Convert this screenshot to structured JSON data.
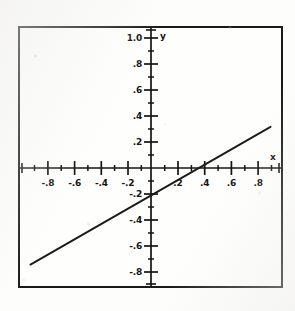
{
  "chart_data": {
    "type": "line",
    "title": "",
    "subtitle": "",
    "xlabel": "x",
    "ylabel": "y",
    "xlim": [
      -1.0,
      1.0
    ],
    "ylim": [
      -1.0,
      1.0
    ],
    "grid": false,
    "legend": null,
    "x_tick_labels": [
      "-.8",
      "-.6",
      "-.4",
      "-.2",
      ".2",
      ".4",
      ".6",
      ".8"
    ],
    "x_tick_values": [
      -0.8,
      -0.6,
      -0.4,
      -0.2,
      0.2,
      0.4,
      0.6,
      0.8
    ],
    "y_tick_labels": [
      "1.0",
      ".8",
      ".6",
      ".4",
      ".2",
      "-.2",
      "-.4",
      "-.6",
      "-.8"
    ],
    "y_tick_values": [
      1.0,
      0.8,
      0.6,
      0.4,
      0.2,
      -0.2,
      -0.4,
      -0.6,
      -0.8
    ],
    "minor_tick_step": 0.1,
    "series": [
      {
        "name": "line",
        "slope": 0.58,
        "intercept": -0.3,
        "x_intercept": 0.52,
        "y_intercept": -0.3,
        "x": [
          -0.92,
          0.92
        ],
        "y": [
          -0.834,
          0.234
        ]
      }
    ],
    "colors": {
      "line": "#1a1a1a",
      "axis": "#141414",
      "frame": "#1a1a1a",
      "background": "#fefefd"
    }
  },
  "axes": {
    "x_name": "x",
    "y_name": "y"
  }
}
